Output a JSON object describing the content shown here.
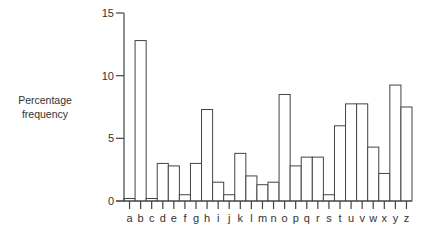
{
  "chart_data": {
    "type": "bar",
    "title": "",
    "xlabel": "",
    "ylabel": "Percentage frequency",
    "ylabel_lines": [
      "Percentage",
      "frequency"
    ],
    "ylim": [
      0,
      15
    ],
    "yticks": [
      0,
      5,
      10,
      15
    ],
    "grid": false,
    "legend": "none",
    "categories": [
      "a",
      "b",
      "c",
      "d",
      "e",
      "f",
      "g",
      "h",
      "i",
      "j",
      "k",
      "l",
      "m",
      "n",
      "o",
      "p",
      "q",
      "r",
      "s",
      "t",
      "u",
      "v",
      "w",
      "x",
      "y",
      "z"
    ],
    "values": [
      0.2,
      12.8,
      0.2,
      3.0,
      2.8,
      0.5,
      3.0,
      7.3,
      1.5,
      0.5,
      3.8,
      2.0,
      1.3,
      1.5,
      8.5,
      2.8,
      3.5,
      3.5,
      0.5,
      6.0,
      7.75,
      7.75,
      4.3,
      2.2,
      9.25,
      7.5
    ],
    "colors": {
      "bar_fill": "#ffffff",
      "bar_stroke": "#444444",
      "axis": "#444444"
    }
  }
}
